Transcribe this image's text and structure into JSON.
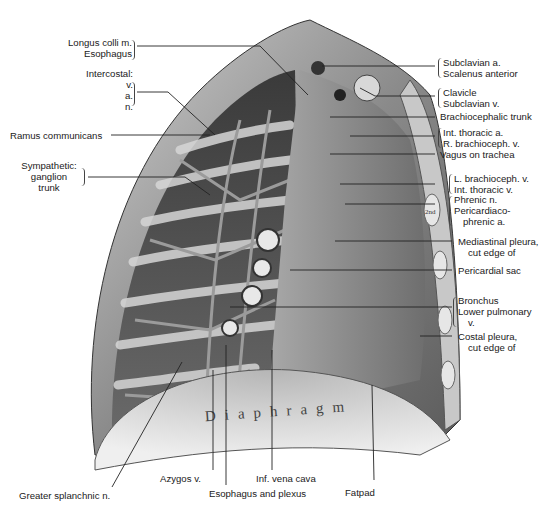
{
  "figure": {
    "in_image_text": {
      "diaphragm": "Diaphragm",
      "rib_label": "2nd rib"
    },
    "colors": {
      "background": "#ffffff",
      "ink": "#1a1a1a",
      "leader": "#222222"
    }
  },
  "labels_left": [
    {
      "id": "longus",
      "lines": [
        "Longus colli m.",
        "Esophagus"
      ]
    },
    {
      "id": "intercostal",
      "lines": [
        "Intercostal:",
        "v.",
        "a.",
        "n."
      ]
    },
    {
      "id": "ramus",
      "lines": [
        "Ramus communicans"
      ]
    },
    {
      "id": "sympathetic",
      "lines": [
        "Sympathetic:",
        "ganglion",
        "trunk"
      ]
    }
  ],
  "labels_right": [
    {
      "id": "subclavian-a",
      "lines": [
        "Subclavian a.",
        "Scalenus anterior"
      ]
    },
    {
      "id": "clavicle",
      "lines": [
        "Clavicle",
        "Subclavian v."
      ]
    },
    {
      "id": "brachiocephalic-trunk",
      "lines": [
        "Brachiocephalic trunk"
      ]
    },
    {
      "id": "int-thoracic-a",
      "lines": [
        "Int. thoracic a.",
        "R. brachioceph. v."
      ]
    },
    {
      "id": "vagus",
      "lines": [
        "Vagus on trachea"
      ]
    },
    {
      "id": "l-brachioceph",
      "lines": [
        "L. brachioceph. v.",
        "Int. thoracic v."
      ]
    },
    {
      "id": "phrenic",
      "lines": [
        "Phrenic n.",
        "Pericardiaco-",
        "phrenic a."
      ]
    },
    {
      "id": "mediastinal-pleura",
      "lines": [
        "Mediastinal pleura,",
        "cut edge of"
      ]
    },
    {
      "id": "pericardial-sac",
      "lines": [
        "Pericardial sac"
      ]
    },
    {
      "id": "bronchus",
      "lines": [
        "Bronchus",
        "Lower pulmonary",
        "v."
      ]
    },
    {
      "id": "costal-pleura",
      "lines": [
        "Costal pleura,",
        "cut edge of"
      ]
    }
  ],
  "labels_bottom": [
    {
      "id": "greater-splanchnic",
      "lines": [
        "Greater splanchnic n."
      ]
    },
    {
      "id": "azygos",
      "lines": [
        "Azygos v."
      ]
    },
    {
      "id": "esophagus-plexus",
      "lines": [
        "Esophagus and plexus"
      ]
    },
    {
      "id": "ivc",
      "lines": [
        "Inf. vena cava"
      ]
    },
    {
      "id": "fatpad",
      "lines": [
        "Fatpad"
      ]
    }
  ]
}
